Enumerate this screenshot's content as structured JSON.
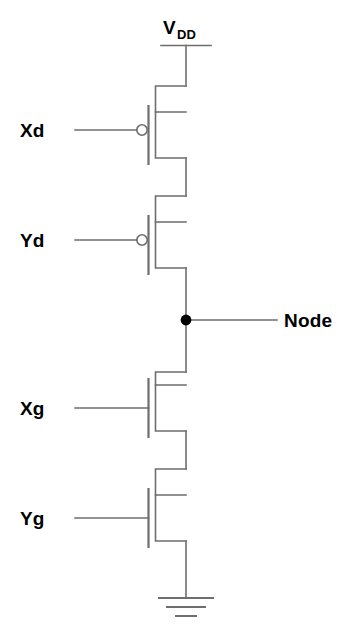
{
  "diagram": {
    "supply": {
      "label": "V",
      "subscript": "DD",
      "name": "vdd-rail"
    },
    "output": {
      "label": "Node"
    },
    "ground": {
      "label": ""
    },
    "transistors": [
      {
        "id": "pmos-xd",
        "input_label": "Xd",
        "type": "pmos",
        "inverted_gate": true
      },
      {
        "id": "pmos-yd",
        "input_label": "Yd",
        "type": "pmos",
        "inverted_gate": true
      },
      {
        "id": "nmos-xg",
        "input_label": "Xg",
        "type": "nmos",
        "inverted_gate": false
      },
      {
        "id": "nmos-yg",
        "input_label": "Yg",
        "type": "nmos",
        "inverted_gate": false
      }
    ],
    "colors": {
      "wire": "#6e6e6e",
      "text": "#000000",
      "background": "#ffffff",
      "junction": "#000000"
    }
  }
}
